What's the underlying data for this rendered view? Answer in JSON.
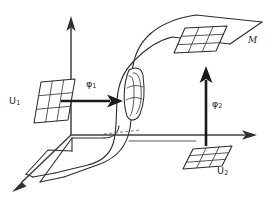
{
  "figure": {
    "kind": "manifold-chart-diagram",
    "background_color": "#ffffff",
    "ink_color": "#2b2b2b",
    "width": 276,
    "height": 202
  },
  "labels": {
    "chart_domain_1": "U",
    "chart_domain_1_sub": "1",
    "chart_domain_2": "U",
    "chart_domain_2_sub": "2",
    "map_1": "φ",
    "map_1_sub": "1",
    "map_2": "φ",
    "map_2_sub": "2",
    "manifold": "M"
  },
  "elements": {
    "manifold_surface": "s-curved-sheet",
    "axis_vertical": "vertical-axis-up",
    "axis_horizontal": "horizontal-axis-right",
    "axis_depth": "depth-axis-front-left",
    "patch_u1": "grid-patch-left",
    "patch_u2": "grid-patch-bottom-right",
    "patch_on_manifold_upper": "grid-patch-on-upper-sheet",
    "patch_on_manifold_middle": "grid-patch-on-curved-fold",
    "arrow_phi1": "horizontal-map-arrow",
    "arrow_phi2": "vertical-map-arrow",
    "hidden_edge": "dashed-hidden-edge"
  }
}
